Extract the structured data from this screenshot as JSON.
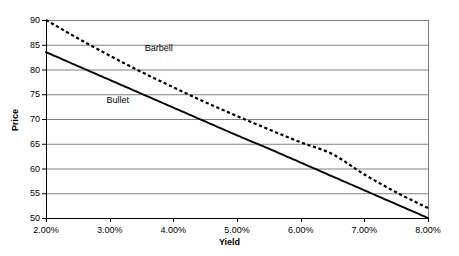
{
  "chart_data": {
    "type": "line",
    "title": "",
    "xlabel": "Yield",
    "ylabel": "Price",
    "xlim": [
      2.0,
      8.0
    ],
    "ylim": [
      50,
      90
    ],
    "grid": true,
    "legend_position": "inline-annotations",
    "x_tick_labels": [
      "2.00%",
      "3.00%",
      "4.00%",
      "5.00%",
      "6.00%",
      "7.00%",
      "8.00%"
    ],
    "x_tick_values": [
      2.0,
      3.0,
      4.0,
      5.0,
      6.0,
      7.0,
      8.0
    ],
    "y_tick_labels": [
      "50",
      "55",
      "60",
      "65",
      "70",
      "75",
      "80",
      "85",
      "90"
    ],
    "y_tick_values": [
      50,
      55,
      60,
      65,
      70,
      75,
      80,
      85,
      90
    ],
    "x": [
      2.0,
      2.5,
      3.0,
      3.5,
      4.0,
      4.5,
      5.0,
      5.5,
      6.0,
      6.5,
      7.0,
      7.5,
      8.0
    ],
    "series": [
      {
        "name": "Barbell",
        "style": "dotted",
        "color": "#000000",
        "values": [
          90.0,
          86.3,
          82.8,
          79.5,
          76.4,
          73.4,
          70.6,
          67.9,
          65.3,
          62.9,
          58.8,
          55.2,
          52.0
        ]
      },
      {
        "name": "Bullet",
        "style": "solid",
        "color": "#000000",
        "values": [
          83.5,
          80.7,
          77.9,
          75.1,
          72.3,
          69.5,
          66.7,
          64.0,
          61.2,
          58.4,
          55.6,
          52.8,
          50.0
        ]
      }
    ],
    "annotations": [
      {
        "text": "Barbell",
        "x": 3.55,
        "y": 84.2
      },
      {
        "text": "Bullet",
        "x": 2.95,
        "y": 73.6
      }
    ],
    "colors": {
      "axis": "#000000",
      "gridline": "#808080",
      "plot_background": "#ffffff",
      "series_line": "#000000"
    }
  }
}
